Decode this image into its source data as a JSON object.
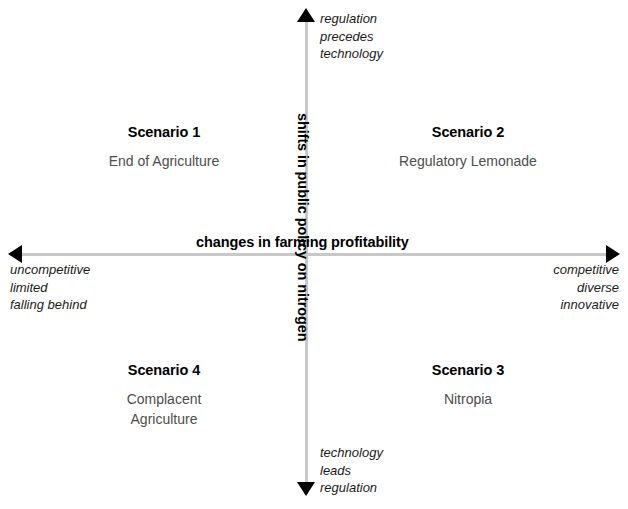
{
  "diagram": {
    "type": "2x2-scenario-matrix",
    "axes": {
      "horizontal": {
        "title": "changes in farming profitability",
        "negative_pole": [
          "uncompetitive",
          "limited",
          "falling behind"
        ],
        "positive_pole": [
          "competitive",
          "diverse",
          "innovative"
        ]
      },
      "vertical": {
        "title": "shifts in public policy on nitrogen",
        "positive_pole": [
          "regulation",
          "precedes",
          "technology"
        ],
        "negative_pole": [
          "technology",
          "leads",
          "regulation"
        ]
      }
    },
    "quadrants": [
      {
        "id": "q1",
        "position": "top-left",
        "title": "Scenario 1",
        "name_lines": [
          "End of Agriculture"
        ]
      },
      {
        "id": "q2",
        "position": "top-right",
        "title": "Scenario 2",
        "name_lines": [
          "Regulatory Lemonade"
        ]
      },
      {
        "id": "q3",
        "position": "bottom-right",
        "title": "Scenario 3",
        "name_lines": [
          "Nitropia"
        ]
      },
      {
        "id": "q4",
        "position": "bottom-left",
        "title": "Scenario 4",
        "name_lines": [
          "Complacent",
          "Agriculture"
        ]
      }
    ],
    "colors": {
      "axis_line": "#c8c8c8",
      "arrow_head": "#000000",
      "heading_text": "#000000",
      "subtitle_text": "#4d4d4d",
      "pole_text": "#1a1a1a",
      "background": "#ffffff"
    }
  }
}
